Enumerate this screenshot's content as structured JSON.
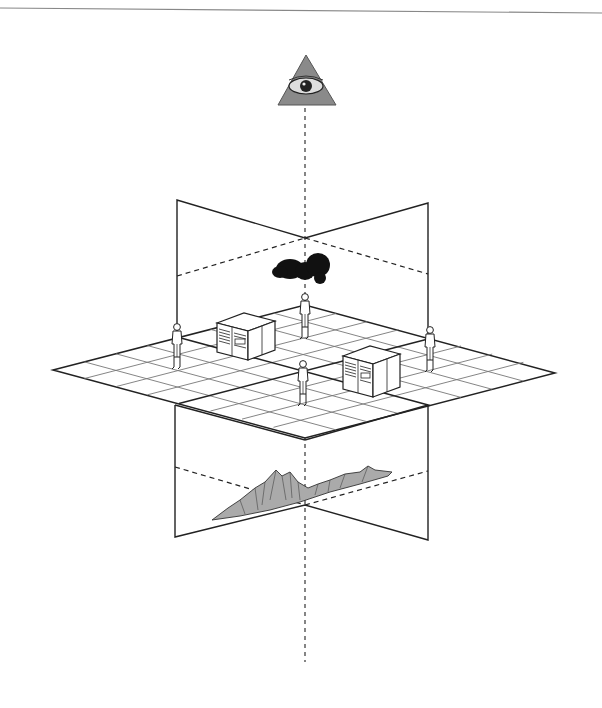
{
  "diagram": {
    "colors": {
      "background": "#ffffff",
      "line": "#222222",
      "grid": "#777777",
      "pyramid_fill": "#8a8a8a",
      "cloud": "#111111"
    },
    "elements": {
      "eye_icon": "all-seeing-eye",
      "cloud_icon": "dark-cloud",
      "mountain_icon": "mountain-range",
      "figures_count": 5,
      "server_cabinets_count": 2
    }
  }
}
